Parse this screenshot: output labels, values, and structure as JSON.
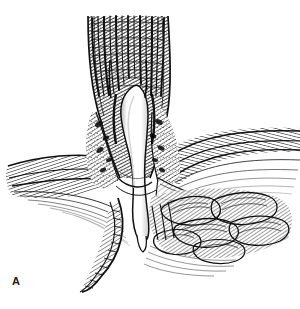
{
  "figure": {
    "panel_label": "A",
    "caption_fragment": "",
    "background_color": "#ffffff",
    "ink_color": "#111111",
    "lumen_color": "#ffffff",
    "midtone_color": "#6e6e6e",
    "illustration_style": "pen-and-ink engraving hatching",
    "width": 300,
    "height": 309
  },
  "structures": [
    {
      "name": "esophagus",
      "description": "vertical muscular tube with longitudinal striations entering from top of frame",
      "x_range": [
        86,
        168
      ],
      "y_range": [
        18,
        130
      ]
    },
    {
      "name": "esophageal-lumen",
      "description": "white slit-like lumen running down the center",
      "x_range": [
        118,
        150
      ],
      "y_range": [
        86,
        243
      ]
    },
    {
      "name": "left-diaphragm-crus",
      "description": "hatched band sweeping down and to the left",
      "x_range": [
        8,
        120
      ],
      "y_range": [
        158,
        205
      ]
    },
    {
      "name": "right-diaphragm-crus",
      "description": "hatched band sweeping to the right edge of frame",
      "x_range": [
        160,
        300
      ],
      "y_range": [
        128,
        200
      ]
    },
    {
      "name": "gastric-rugae",
      "description": "fan of stomach folds at lower right",
      "x_range": [
        150,
        292
      ],
      "y_range": [
        188,
        262
      ]
    },
    {
      "name": "stomach-wall",
      "description": "curved wall descending to lower left",
      "x_range": [
        80,
        165
      ],
      "y_range": [
        200,
        292
      ]
    },
    {
      "name": "phrenoesophageal-membrane",
      "description": "thin sheet tethering esophagus to hiatus",
      "x_range": [
        140,
        230
      ],
      "y_range": [
        160,
        215
      ]
    }
  ]
}
